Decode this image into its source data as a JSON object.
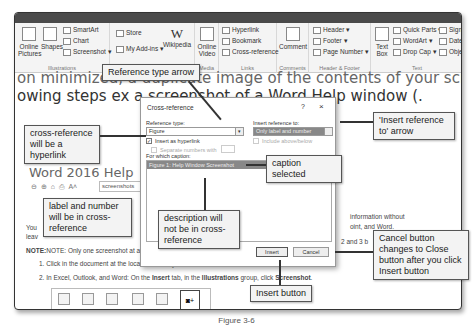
{
  "ribbon": {
    "tabs": [
      "Layout",
      "References",
      "Tell me what you want to do"
    ],
    "groups": [
      {
        "name": "Illustrations",
        "items": [
          "Online Pictures",
          "Shapes",
          "SmartArt",
          "Chart",
          "Screenshot"
        ]
      },
      {
        "name": "Add-ins",
        "items": [
          "Store",
          "My Add-ins",
          "Wikipedia"
        ]
      },
      {
        "name": "Media",
        "items": [
          "Online Video"
        ]
      },
      {
        "name": "Links",
        "items": [
          "Hyperlink",
          "Bookmark",
          "Cross-reference"
        ]
      },
      {
        "name": "Comments",
        "items": [
          "Comment"
        ]
      },
      {
        "name": "Header & Footer",
        "items": [
          "Header",
          "Footer",
          "Page Number"
        ]
      },
      {
        "name": "Text",
        "items": [
          "Text Box",
          "Quick Parts",
          "WordArt",
          "Drop Cap",
          "Signature Line",
          "Date & Time",
          "Object"
        ]
      }
    ]
  },
  "document": {
    "line1": "on minimized, a duplicate image of the contents of your screen. In",
    "line2": "owing steps ex                          a screenshot of a Word Help window (."
  },
  "dialog": {
    "title": "Cross-reference",
    "help": "?",
    "close": "×",
    "reference_type_label": "Reference type:",
    "reference_type_value": "Figure",
    "insert_reference_to_label": "Insert reference to:",
    "insert_reference_to_value": "Only label and number",
    "insert_as_hyperlink": "Insert as hyperlink",
    "insert_as_hyperlink_checked": true,
    "include_above_below": "Include above/below",
    "separate_numbers_with": "Separate numbers with",
    "for_which_caption_label": "For which caption:",
    "caption_selected": "Figure 1: Help Window Screenshot",
    "insert_button": "Insert",
    "cancel_button": "Cancel"
  },
  "help_window": {
    "title": "Word 2016 Help",
    "search_value": "screenshots",
    "body1_start": "You",
    "body1_end": "information without",
    "body2_start": "leav",
    "body2_end": "oint, and Word.",
    "note": "NOTE:  Only one screenshot at a t",
    "note_end": "2 and 3 b",
    "step1": "1.  Click in the document at the location where you want to add the screenshot.",
    "step2_pre": "2.  In Excel, Outlook, and Word: On the ",
    "step2_insert": "Insert",
    "step2_mid": " tab, in the ",
    "step2_illus": "Illustrations",
    "step2_post": " group, click ",
    "step2_ss": "Screenshot",
    "step2_end": ".",
    "tray_labels": [
      "Shapes",
      "SmartArt",
      "Chart",
      "Screenshot"
    ]
  },
  "callouts": {
    "reference_type_arrow": "Reference type arrow",
    "insert_reference_to_arrow": "'Insert reference to' arrow",
    "hyperlink": "cross-reference will be a hyperlink",
    "caption_selected": "caption selected",
    "label_number": "label and number will be in cross-reference",
    "description": "description will not be in cross-reference",
    "cancel_close": "Cancel button changes to Close button after you click Insert button",
    "insert_button": "Insert button"
  },
  "figure_caption": "Figure 3-6"
}
